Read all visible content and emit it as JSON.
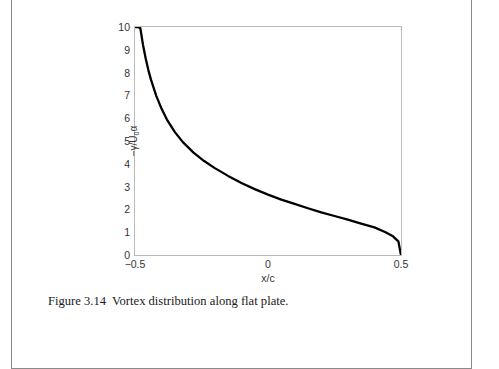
{
  "figure": {
    "caption_label": "Figure 3.14",
    "caption_text": "Vortex distribution along flat plate.",
    "border_color": "#8a8a8a"
  },
  "chart_data": {
    "type": "line",
    "title": "",
    "xlabel": "x/c",
    "ylabel_plain": "-y/U0a",
    "ylabel_parts": {
      "prefix": "−γ/U",
      "sub": "0",
      "suffix": "α"
    },
    "xlim": [
      -0.5,
      0.5
    ],
    "ylim": [
      0,
      10
    ],
    "xticks": [
      -0.5,
      0,
      0.5
    ],
    "xtick_labels": [
      "−0.5",
      "0",
      "0.5"
    ],
    "yticks": [
      0,
      1,
      2,
      3,
      4,
      5,
      6,
      7,
      8,
      9,
      10
    ],
    "ytick_labels": [
      "0",
      "1",
      "2",
      "3",
      "4",
      "5",
      "6",
      "7",
      "8",
      "9",
      "10"
    ],
    "grid": false,
    "legend": "none",
    "line_color": "#000000",
    "line_width": 2.3,
    "axis_color": "#b9b9b9",
    "series": [
      {
        "name": "vortex strength",
        "formula": "sqrt((0.5 - x)/(0.5 + x)), clipped at 10",
        "x": [
          -0.5,
          -0.49,
          -0.48,
          -0.47,
          -0.46,
          -0.45,
          -0.44,
          -0.42,
          -0.4,
          -0.38,
          -0.35,
          -0.32,
          -0.28,
          -0.24,
          -0.2,
          -0.15,
          -0.1,
          -0.05,
          0.0,
          0.05,
          0.1,
          0.15,
          0.2,
          0.25,
          0.3,
          0.35,
          0.4,
          0.44,
          0.47,
          0.49,
          0.5
        ],
        "y": [
          10.0,
          10.0,
          9.95,
          9.22,
          8.63,
          8.12,
          7.69,
          6.98,
          6.41,
          5.94,
          5.39,
          4.95,
          4.49,
          4.12,
          3.81,
          3.47,
          3.16,
          2.89,
          2.65,
          2.43,
          2.24,
          2.05,
          1.87,
          1.71,
          1.55,
          1.38,
          1.21,
          1.01,
          0.82,
          0.6,
          0.0
        ]
      }
    ]
  }
}
